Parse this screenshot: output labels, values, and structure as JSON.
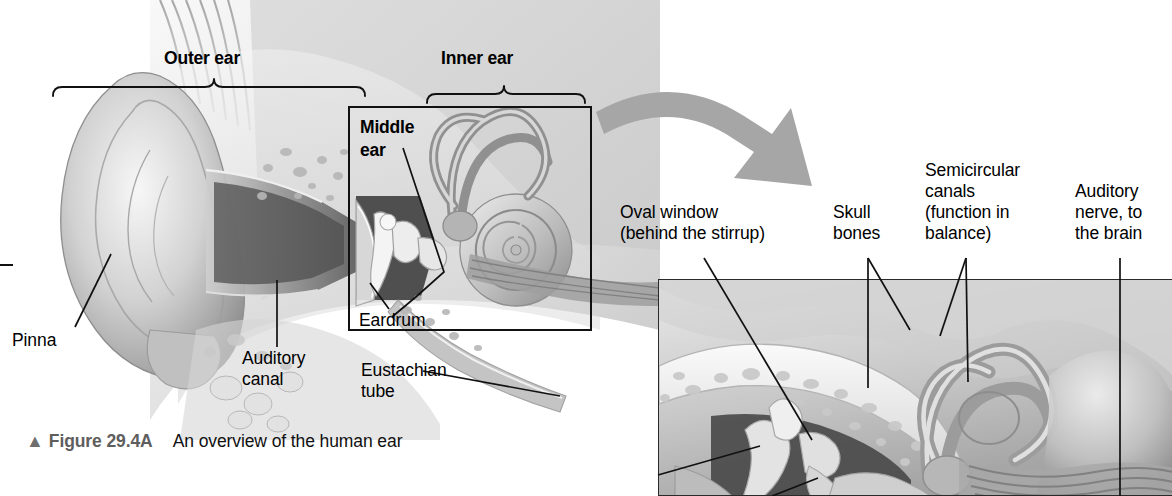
{
  "figure": {
    "caption_mark": "▲",
    "caption_figure": "Figure 29.4A",
    "caption_text": "An overview of the human ear",
    "title": "An overview of the human ear"
  },
  "overview": {
    "brackets": [
      {
        "id": "outer-ear",
        "label": "Outer ear"
      },
      {
        "id": "inner-ear",
        "label": "Inner ear"
      }
    ],
    "callout_box_label_line1": "Middle",
    "callout_box_label_line2": "ear",
    "labels": [
      {
        "id": "pinna",
        "text": "Pinna"
      },
      {
        "id": "auditory-canal",
        "line1": "Auditory",
        "line2": "canal"
      },
      {
        "id": "eardrum",
        "text": "Eardrum"
      },
      {
        "id": "eustachian-tube",
        "line1": "Eustachian",
        "line2": "tube"
      }
    ]
  },
  "detail": {
    "labels": [
      {
        "id": "oval-window",
        "line1": "Oval window",
        "line2": "(behind the stirrup)"
      },
      {
        "id": "skull-bones",
        "line1": "Skull",
        "line2": "bones"
      },
      {
        "id": "semicircular-canals",
        "line1": "Semicircular",
        "line2": "canals",
        "line3": "(function in",
        "line4": "balance)"
      },
      {
        "id": "auditory-nerve",
        "line1": "Auditory",
        "line2": "nerve, to",
        "line3": "the brain"
      }
    ]
  },
  "icons": {
    "zoom_arrow": "curved-arrow-icon",
    "caption_triangle": "triangle-up-icon"
  },
  "colors": {
    "page_background": "#ffffff",
    "text": "#000000",
    "caption_gray": "#5e5e5e",
    "arrow_gray": "#a6a6a6",
    "box_outline": "#111111",
    "art_mid": "#b9b9b9",
    "art_dark": "#6a6a6a",
    "art_light": "#e8e8e8"
  }
}
